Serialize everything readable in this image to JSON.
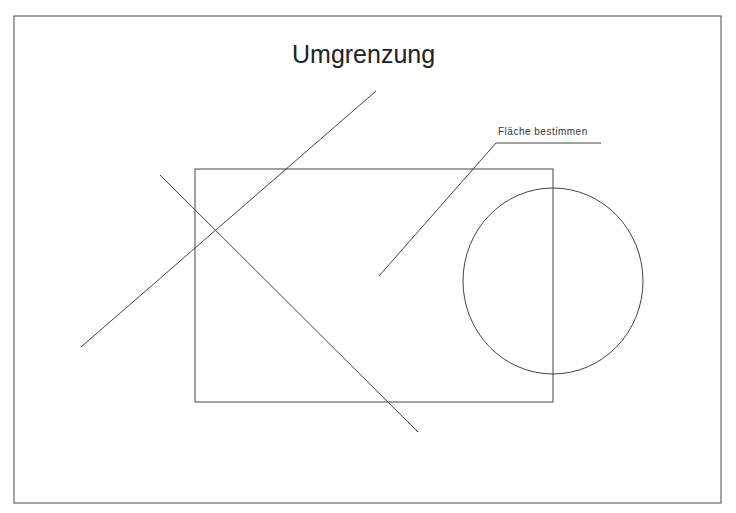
{
  "drawing": {
    "title": "Umgrenzung",
    "annotation": "Fläche bestimmen",
    "stroke_color": "#444444",
    "frame": {
      "x1": 14,
      "y1": 16,
      "x2": 721,
      "y2": 503
    },
    "rectangle": {
      "x1": 195,
      "y1": 169,
      "x2": 553,
      "y2": 402
    },
    "circle": {
      "cx": 553,
      "cy": 281,
      "rx": 90,
      "ry": 93
    },
    "lines": [
      {
        "name": "diagonal-line-1",
        "x1": 376,
        "y1": 91,
        "x2": 81,
        "y2": 347
      },
      {
        "name": "diagonal-line-2",
        "x1": 160,
        "y1": 175,
        "x2": 418,
        "y2": 432
      }
    ],
    "leader": {
      "points": [
        [
          379,
          276
        ],
        [
          496,
          143
        ],
        [
          601,
          143
        ]
      ]
    }
  }
}
